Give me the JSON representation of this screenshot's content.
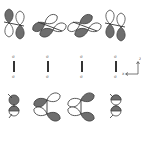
{
  "diagram": {
    "type": "molecular-orbital-overlap",
    "colors": {
      "filled_lobe": "#6e6e6e",
      "open_lobe": "#ffffff",
      "outline": "#444444",
      "bond": "#333333"
    },
    "rows": [
      {
        "name": "top-row-p-orbitals",
        "items": [
          {
            "id": "top-1",
            "orientation": "vertical-pair",
            "description": "two vertical p-orbitals, filled lobe up-left, filled lobe down-right"
          },
          {
            "id": "top-2",
            "orientation": "tilted-pair",
            "description": "tilted p-orbitals, open upper-left, filled lower-right"
          },
          {
            "id": "top-3",
            "orientation": "tilted-pair",
            "description": "tilted p-orbitals, filled upper-left, filled lower-right"
          },
          {
            "id": "top-4",
            "orientation": "vertical-pair",
            "description": "two vertical p-orbitals, filled lower lobes"
          }
        ]
      },
      {
        "name": "middle-row-bonds",
        "items": [
          {
            "id": "mid-1",
            "top_label": "σ",
            "bottom_label": "σ"
          },
          {
            "id": "mid-2",
            "top_label": "σ",
            "bottom_label": "σ"
          },
          {
            "id": "mid-3",
            "top_label": "σ",
            "bottom_label": "σ"
          },
          {
            "id": "mid-4",
            "top_label": "σ",
            "bottom_label": "σ"
          }
        ],
        "axes": {
          "x_label": "x",
          "z_label": "z"
        }
      },
      {
        "name": "bottom-row-p-orbitals",
        "items": [
          {
            "id": "bot-1",
            "description": "stacked spherical-like lobes, filled upper, open lower"
          },
          {
            "id": "bot-2",
            "description": "vertical bond with open top lobe and filled bottom lobe"
          },
          {
            "id": "bot-3",
            "description": "vertical bond with filled top lobe and filled bottom lobe"
          },
          {
            "id": "bot-4",
            "description": "stacked lobes, filled/open alternating"
          }
        ]
      }
    ]
  }
}
